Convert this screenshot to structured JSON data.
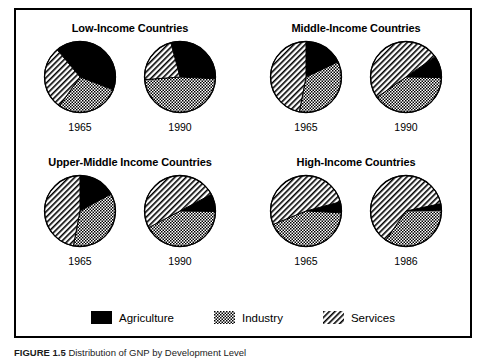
{
  "figure": {
    "caption_label": "FIGURE 1.5",
    "caption_text": "Distribution of GNP by Development Level",
    "legend": {
      "items": [
        {
          "label": "Agriculture",
          "pattern": "solid-black",
          "color": "#000000"
        },
        {
          "label": "Industry",
          "pattern": "checkerboard",
          "color": "#000000"
        },
        {
          "label": "Services",
          "pattern": "diagonal-hatch",
          "color": "#000000"
        }
      ]
    }
  },
  "chart_data": {
    "type": "pie",
    "title": "Distribution of GNP by Development Level",
    "categories": [
      "Agriculture",
      "Industry",
      "Services"
    ],
    "units": "percent of GNP",
    "legend_position": "bottom",
    "grid": false,
    "panels": [
      {
        "title": "Low-Income Countries",
        "position": "top-left",
        "pies": [
          {
            "year": "1965",
            "values": [
              42,
              29,
              29
            ],
            "start_angle_deg": 320
          },
          {
            "year": "1990",
            "values": [
              30,
              48,
              22
            ],
            "start_angle_deg": 345
          }
        ]
      },
      {
        "title": "Middle-Income Countries",
        "position": "top-right",
        "pies": [
          {
            "year": "1965",
            "values": [
              18,
              35,
              47
            ],
            "start_angle_deg": 0
          },
          {
            "year": "1990",
            "values": [
              10,
              40,
              50
            ],
            "start_angle_deg": 55
          }
        ]
      },
      {
        "title": "Upper-Middle Income Countries",
        "position": "bottom-left",
        "pies": [
          {
            "year": "1965",
            "values": [
              17,
              36,
              47
            ],
            "start_angle_deg": 0
          },
          {
            "year": "1990",
            "values": [
              8,
              42,
              50
            ],
            "start_angle_deg": 62
          }
        ]
      },
      {
        "title": "High-Income Countries",
        "position": "bottom-right",
        "pies": [
          {
            "year": "1965",
            "values": [
              5,
              43,
              52
            ],
            "start_angle_deg": 75
          },
          {
            "year": "1986",
            "values": [
              3,
              35,
              62
            ],
            "start_angle_deg": 78
          }
        ]
      }
    ]
  }
}
